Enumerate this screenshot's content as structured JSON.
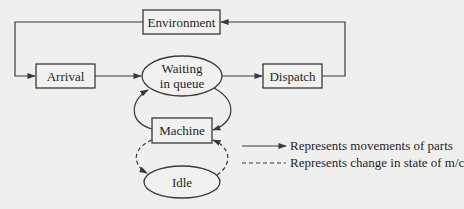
{
  "diagram": {
    "nodes": {
      "environment": {
        "label": "Environment",
        "shape": "rectangle"
      },
      "arrival": {
        "label": "Arrival",
        "shape": "rectangle"
      },
      "waiting": {
        "label_line1": "Waiting",
        "label_line2": "in queue",
        "shape": "ellipse"
      },
      "dispatch": {
        "label": "Dispatch",
        "shape": "rectangle"
      },
      "machine": {
        "label": "Machine",
        "shape": "rectangle"
      },
      "idle": {
        "label": "Idle",
        "shape": "ellipse"
      }
    },
    "edges": [
      {
        "from": "environment",
        "to": "arrival",
        "style": "solid"
      },
      {
        "from": "arrival",
        "to": "waiting",
        "style": "solid"
      },
      {
        "from": "waiting",
        "to": "dispatch",
        "style": "solid"
      },
      {
        "from": "dispatch",
        "to": "environment",
        "style": "solid"
      },
      {
        "from": "waiting",
        "to": "machine",
        "style": "solid"
      },
      {
        "from": "machine",
        "to": "waiting",
        "style": "solid"
      },
      {
        "from": "machine",
        "to": "idle",
        "style": "dashed"
      },
      {
        "from": "idle",
        "to": "machine",
        "style": "dashed"
      }
    ],
    "legend": [
      {
        "style": "solid-arrow",
        "label": "Represents movements of parts"
      },
      {
        "style": "dashed",
        "label": "Represents change in state of m/c"
      }
    ],
    "colors": {
      "background": "#efefed",
      "stroke": "#3a3a3a",
      "text": "#262626"
    }
  }
}
